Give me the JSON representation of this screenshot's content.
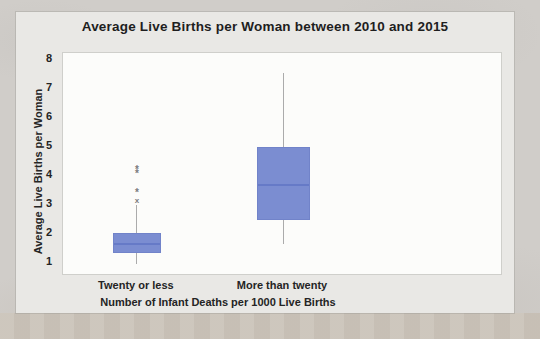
{
  "page": {
    "background_color": "#d0cdc9",
    "bottom_strip_color": "#cbc4ba",
    "chart_background_color": "#e9e8e5",
    "plot_background_color": "#fcfcfa"
  },
  "chart_colors": {
    "box_fill": "#7b8dd1",
    "box_edge": "#7183c9",
    "median_line": "#6377c5",
    "whisker_line": "#ababab",
    "outlier_marker": "#7a7a7a",
    "text": "#242424"
  },
  "chart_data": {
    "type": "boxplot",
    "title": "Average Live Births per Woman between 2010 and 2015",
    "xlabel": "Number of Infant Deaths per 1000 Live Births",
    "ylabel": "Average Live Births per Woman",
    "categories": [
      "Twenty or less",
      "More than twenty"
    ],
    "yticks": [
      1,
      2,
      3,
      4,
      5,
      6,
      7,
      8
    ],
    "ylim": [
      0.5,
      8.2
    ],
    "grid": false,
    "legend": "none",
    "series": [
      {
        "category": "Twenty or less",
        "whisker_low": 0.9,
        "q1": 1.3,
        "median": 1.6,
        "q3": 2.0,
        "whisker_high": 2.95,
        "outliers": [
          {
            "value": 3.1,
            "marker": "x"
          },
          {
            "value": 3.4,
            "marker": "asterisk"
          },
          {
            "value": 4.05,
            "marker": "asterisk"
          },
          {
            "value": 4.2,
            "marker": "asterisk"
          }
        ]
      },
      {
        "category": "More than twenty",
        "whisker_low": 1.6,
        "q1": 2.45,
        "median": 3.65,
        "q3": 4.95,
        "whisker_high": 7.5,
        "outliers": []
      }
    ]
  }
}
